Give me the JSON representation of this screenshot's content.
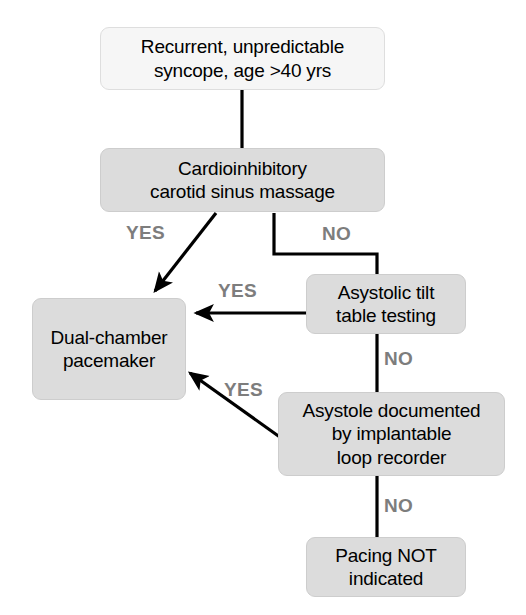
{
  "diagram": {
    "canvas": {
      "width": 526,
      "height": 615
    },
    "colors": {
      "node_light_fill": "#f6f6f6",
      "node_shaded_fill": "#dcdcdc",
      "node_border": "#cdcdcd",
      "edge_stroke": "#000000",
      "edge_label_color": "#7d7d7d",
      "text_color": "#000000",
      "background": "#ffffff"
    },
    "nodes": [
      {
        "id": "presentation",
        "style": "light",
        "lines": [
          "Recurrent, unpredictable",
          "syncope, age >40 yrs"
        ],
        "x": 100,
        "y": 27,
        "w": 285,
        "h": 63
      },
      {
        "id": "carotid-massage",
        "style": "shaded",
        "lines": [
          "Cardioinhibitory",
          "carotid sinus massage"
        ],
        "x": 100,
        "y": 148,
        "w": 285,
        "h": 64
      },
      {
        "id": "tilt-table",
        "style": "shaded",
        "lines": [
          "Asystolic tilt",
          "table testing"
        ],
        "x": 306,
        "y": 274,
        "w": 160,
        "h": 60
      },
      {
        "id": "pacemaker",
        "style": "shaded",
        "lines": [
          "Dual-chamber",
          "pacemaker"
        ],
        "x": 32,
        "y": 298,
        "w": 154,
        "h": 102
      },
      {
        "id": "loop-recorder",
        "style": "shaded",
        "lines": [
          "Asystole documented",
          "by implantable",
          "loop recorder"
        ],
        "x": 278,
        "y": 392,
        "w": 227,
        "h": 84
      },
      {
        "id": "no-pacing",
        "style": "shaded",
        "lines": [
          "Pacing NOT",
          "indicated"
        ],
        "x": 306,
        "y": 537,
        "w": 160,
        "h": 60
      }
    ],
    "edges": [
      {
        "id": "presentation-to-massage",
        "from": "presentation",
        "to": "carotid-massage",
        "label": "",
        "arrow": false
      },
      {
        "id": "massage-yes-to-pacemaker",
        "from": "carotid-massage",
        "to": "pacemaker",
        "label": "YES",
        "arrow": true
      },
      {
        "id": "massage-no-to-tilt",
        "from": "carotid-massage",
        "to": "tilt-table",
        "label": "NO",
        "arrow": false
      },
      {
        "id": "tilt-yes-to-pacemaker",
        "from": "tilt-table",
        "to": "pacemaker",
        "label": "YES",
        "arrow": true
      },
      {
        "id": "tilt-no-to-loop",
        "from": "tilt-table",
        "to": "loop-recorder",
        "label": "NO",
        "arrow": false
      },
      {
        "id": "loop-yes-to-pacemaker",
        "from": "loop-recorder",
        "to": "pacemaker",
        "label": "YES",
        "arrow": true
      },
      {
        "id": "loop-no-to-nopacing",
        "from": "loop-recorder",
        "to": "no-pacing",
        "label": "NO",
        "arrow": false
      }
    ],
    "edge_labels": [
      {
        "id": "label-massage-yes",
        "text": "YES",
        "x": 126,
        "y": 222
      },
      {
        "id": "label-massage-no",
        "text": "NO",
        "x": 322,
        "y": 223
      },
      {
        "id": "label-tilt-yes",
        "text": "YES",
        "x": 218,
        "y": 280
      },
      {
        "id": "label-tilt-no",
        "text": "NO",
        "x": 384,
        "y": 348
      },
      {
        "id": "label-loop-yes",
        "text": "YES",
        "x": 224,
        "y": 379
      },
      {
        "id": "label-loop-no",
        "text": "NO",
        "x": 384,
        "y": 495
      }
    ]
  }
}
